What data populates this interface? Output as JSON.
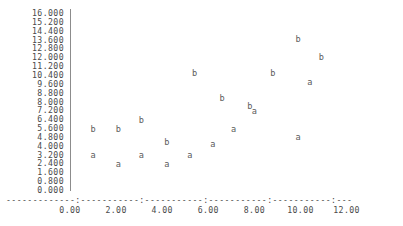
{
  "chart_data": {
    "type": "scatter",
    "title": "",
    "xlabel": "",
    "ylabel": "",
    "xlim": [
      0.0,
      12.0
    ],
    "ylim": [
      0.0,
      16.0
    ],
    "grid": false,
    "legend": "none",
    "marker_style": "text-glyph",
    "x_ticks": [
      "0.00",
      "2.00",
      "4.00",
      "6.00",
      "8.00",
      "10.00",
      "12.00"
    ],
    "x_tick_values": [
      0.0,
      2.0,
      4.0,
      6.0,
      8.0,
      10.0,
      12.0
    ],
    "y_ticks": [
      "16.000",
      "15.200",
      "14.400",
      "13.600",
      "12.800",
      "12.000",
      "11.200",
      "10.400",
      "9.600",
      "8.800",
      "8.000",
      "7.200",
      "6.400",
      "5.600",
      "4.800",
      "4.000",
      "3.200",
      "2.400",
      "1.600",
      "0.800",
      "0.000"
    ],
    "y_tick_values": [
      16.0,
      15.2,
      14.4,
      13.6,
      12.8,
      12.0,
      11.2,
      10.4,
      9.6,
      8.8,
      8.0,
      7.2,
      6.4,
      5.6,
      4.8,
      4.0,
      3.2,
      2.4,
      1.6,
      0.8,
      0.0
    ],
    "axis_dash_row": "-------------:-----------:-----------:-----------:-----------:-----------:-----------:",
    "series": [
      {
        "name": "a",
        "label": "a",
        "points": [
          {
            "x": 1.0,
            "y": 3.2
          },
          {
            "x": 2.1,
            "y": 2.4
          },
          {
            "x": 3.1,
            "y": 3.2
          },
          {
            "x": 4.2,
            "y": 2.4
          },
          {
            "x": 5.2,
            "y": 3.2
          },
          {
            "x": 6.2,
            "y": 4.2
          },
          {
            "x": 7.1,
            "y": 5.6
          },
          {
            "x": 8.0,
            "y": 7.2
          },
          {
            "x": 9.9,
            "y": 4.8
          },
          {
            "x": 10.4,
            "y": 9.8
          }
        ]
      },
      {
        "name": "b",
        "label": "b",
        "points": [
          {
            "x": 1.0,
            "y": 5.6
          },
          {
            "x": 2.1,
            "y": 5.6
          },
          {
            "x": 3.1,
            "y": 6.4
          },
          {
            "x": 4.2,
            "y": 4.4
          },
          {
            "x": 5.4,
            "y": 10.6
          },
          {
            "x": 6.6,
            "y": 8.4
          },
          {
            "x": 7.8,
            "y": 7.6
          },
          {
            "x": 8.8,
            "y": 10.6
          },
          {
            "x": 9.9,
            "y": 13.7
          },
          {
            "x": 10.9,
            "y": 12.1
          }
        ]
      }
    ]
  }
}
